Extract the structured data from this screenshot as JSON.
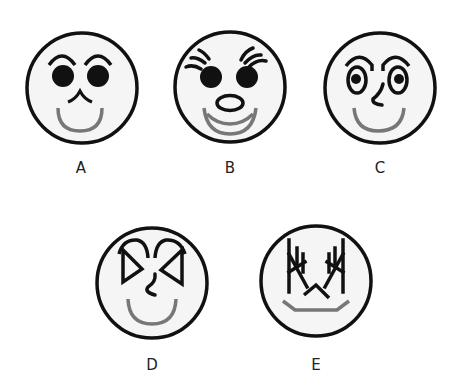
{
  "colors": {
    "outline": "#111111",
    "face_fill": "#f5f5f5",
    "smile": "#777777",
    "background": "#ffffff"
  },
  "faces": [
    {
      "id": "A",
      "label": "A",
      "features": [
        "arched-eyebrows",
        "solid-round-eyes",
        "cat-style-nose",
        "gray-smile"
      ]
    },
    {
      "id": "B",
      "label": "B",
      "features": [
        "eyelashes",
        "solid-round-eyes",
        "oval-nose",
        "double-gray-smile"
      ]
    },
    {
      "id": "C",
      "label": "C",
      "features": [
        "arched-eyebrows",
        "oval-eyes-with-pupils",
        "hook-nose",
        "gray-smile"
      ]
    },
    {
      "id": "D",
      "label": "D",
      "features": [
        "curled-eyebrows",
        "triangular-eyes",
        "squiggle-nose",
        "gray-smile"
      ]
    },
    {
      "id": "E",
      "label": "E",
      "features": [
        "branching-antler-brows",
        "angular-eyes",
        "caret-nose",
        "flat-trapezoid-mouth"
      ]
    }
  ]
}
